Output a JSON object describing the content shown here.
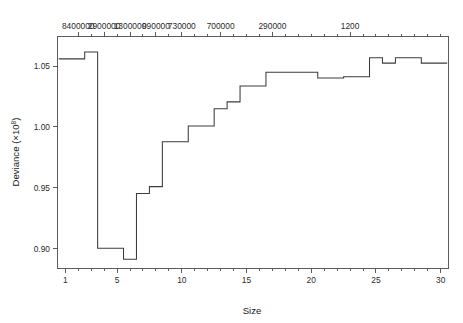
{
  "chart_data": {
    "type": "line",
    "subtype": "step",
    "title": "",
    "xlabel": "Size",
    "ylabel": "Deviance (×10⁸)",
    "ylabel_base": "Deviance (×10",
    "ylabel_exponent": "8",
    "ylabel_close": ")",
    "xlim": [
      0.4,
      30.6
    ],
    "ylim": [
      0.8835,
      1.0745
    ],
    "grid": false,
    "legend": null,
    "x_axis": {
      "position": "bottom",
      "label": "Size",
      "tick_values": [
        1,
        5,
        10,
        15,
        20,
        25,
        30
      ],
      "tick_labels": [
        "1",
        "5",
        "10",
        "15",
        "20",
        "25",
        "30"
      ],
      "minor_ticks": [
        1,
        2,
        3,
        4,
        5,
        6,
        7,
        8,
        9,
        10,
        11,
        12,
        13,
        14,
        15,
        16,
        17,
        18,
        19,
        20,
        21,
        22,
        23,
        24,
        25,
        26,
        27,
        28,
        29,
        30
      ]
    },
    "y_axis": {
      "position": "left",
      "label": "Deviance (×10⁸)",
      "tick_values": [
        0.9,
        0.95,
        1.0,
        1.05
      ],
      "tick_labels": [
        "0.90",
        "0.95",
        "1.00",
        "1.05"
      ]
    },
    "top_axis": {
      "position": "top",
      "label": "",
      "tick_labels": [
        "8400000",
        "2900000",
        "1300000",
        "990000",
        "730000",
        "700000",
        "290000",
        "1200"
      ],
      "tick_positions": [
        2,
        4,
        6,
        8,
        10,
        13,
        17,
        23
      ],
      "minor_tick_positions": [
        2,
        3,
        4,
        5,
        6,
        7,
        8,
        9,
        10,
        11,
        12,
        13,
        14,
        15,
        16,
        17,
        18,
        19,
        20,
        21,
        22,
        23,
        24,
        25,
        26,
        27,
        28,
        29,
        30
      ]
    },
    "x": [
      1,
      2,
      3,
      4,
      5,
      6,
      7,
      8,
      9,
      10,
      11,
      12,
      13,
      14,
      15,
      16,
      17,
      18,
      19,
      20,
      21,
      22,
      23,
      24,
      25,
      26,
      27,
      28,
      29,
      30
    ],
    "values": [
      1.0561,
      1.0561,
      1.0618,
      0.9002,
      0.9002,
      0.8912,
      0.9452,
      0.9509,
      0.9879,
      0.9879,
      1.0008,
      1.0008,
      1.015,
      1.0207,
      1.0338,
      1.0338,
      1.0451,
      1.0451,
      1.0451,
      1.0451,
      1.0404,
      1.0404,
      1.0414,
      1.0414,
      1.057,
      1.0526,
      1.057,
      1.057,
      1.0526,
      1.0526
    ],
    "series": [
      {
        "name": "Deviance",
        "type": "step",
        "step_mode": "mid",
        "color": "#3c3c3c",
        "values": [
          1.0561,
          1.0561,
          1.0618,
          0.9002,
          0.9002,
          0.8912,
          0.9452,
          0.9509,
          0.9879,
          0.9879,
          1.0008,
          1.0008,
          1.015,
          1.0207,
          1.0338,
          1.0338,
          1.0451,
          1.0451,
          1.0451,
          1.0451,
          1.0404,
          1.0404,
          1.0414,
          1.0414,
          1.057,
          1.0526,
          1.057,
          1.057,
          1.0526,
          1.0526
        ]
      }
    ],
    "colors": {
      "line": "#3c3c3c",
      "axis": "#4a4a4a",
      "text": "#1a1a1a",
      "background": "#ffffff"
    }
  }
}
